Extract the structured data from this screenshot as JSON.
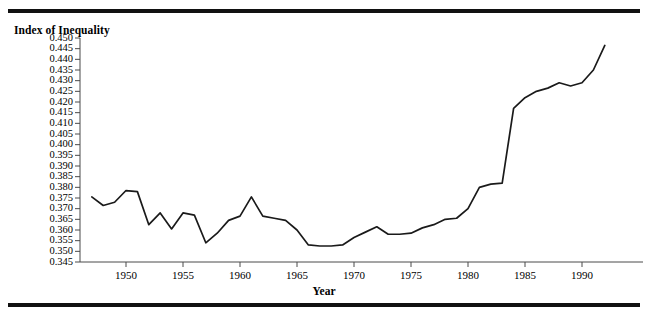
{
  "figure": {
    "y_axis_title": "Index of Inequality",
    "x_axis_title": "Year",
    "line_color": "#1a1a1a",
    "axis_color": "#4a4a4a",
    "rule_color": "#111111"
  },
  "chart_data": {
    "type": "line",
    "title": "",
    "xlabel": "Year",
    "ylabel": "Index of Inequality",
    "xlim": [
      1947,
      1993
    ],
    "ylim": [
      0.345,
      0.45
    ],
    "grid": false,
    "legend": null,
    "xticks": [
      1950,
      1955,
      1960,
      1965,
      1970,
      1975,
      1980,
      1985,
      1990
    ],
    "yticks": [
      0.345,
      0.35,
      0.355,
      0.36,
      0.365,
      0.37,
      0.375,
      0.38,
      0.385,
      0.39,
      0.395,
      0.4,
      0.405,
      0.41,
      0.415,
      0.42,
      0.425,
      0.43,
      0.435,
      0.44,
      0.445,
      0.45
    ],
    "ytick_labels": [
      "0.345",
      "0.350",
      "0.355",
      "0.360",
      "0.365",
      "0.370",
      "0.375",
      "0.380",
      "0.385",
      "0.390",
      "0.395",
      "0.400",
      "0.405",
      "0.410",
      "0.415",
      "0.420",
      "0.425",
      "0.430",
      "0.435",
      "0.440",
      "0.445",
      "0.450"
    ],
    "xtick_labels": [
      "1950",
      "1955",
      "1960",
      "1965",
      "1970",
      "1975",
      "1980",
      "1985",
      "1990"
    ],
    "x": [
      1947,
      1948,
      1949,
      1950,
      1951,
      1952,
      1953,
      1954,
      1955,
      1956,
      1957,
      1958,
      1959,
      1960,
      1961,
      1962,
      1963,
      1964,
      1965,
      1966,
      1967,
      1968,
      1969,
      1970,
      1971,
      1972,
      1973,
      1974,
      1975,
      1976,
      1977,
      1978,
      1979,
      1980,
      1981,
      1982,
      1983,
      1984,
      1985,
      1986,
      1987,
      1988,
      1989,
      1990,
      1991,
      1992
    ],
    "values": [
      0.3755,
      0.3715,
      0.373,
      0.3785,
      0.378,
      0.3625,
      0.368,
      0.3605,
      0.368,
      0.367,
      0.354,
      0.3585,
      0.3645,
      0.3665,
      0.3755,
      0.3665,
      0.3655,
      0.3645,
      0.36,
      0.353,
      0.3525,
      0.3525,
      0.353,
      0.3565,
      0.359,
      0.3615,
      0.358,
      0.358,
      0.3585,
      0.361,
      0.3625,
      0.365,
      0.3655,
      0.37,
      0.38,
      0.3815,
      0.382,
      0.417,
      0.422,
      0.425,
      0.4265,
      0.429,
      0.4275,
      0.429,
      0.435,
      0.4465
    ]
  }
}
